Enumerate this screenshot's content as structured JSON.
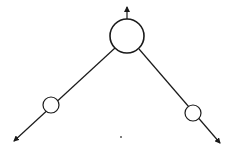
{
  "diagram": {
    "type": "feynman-vertex",
    "stroke_color": "#1a1a1a",
    "background": "#ffffff",
    "vertex": {
      "cx": 127,
      "cy": 36,
      "r": 17
    },
    "top_line": {
      "x1": 127,
      "y1": 19,
      "x2": 127,
      "y2": 7,
      "arrow": "up"
    },
    "left_branch": {
      "line": {
        "x1": 115,
        "y1": 48,
        "x2": 14,
        "y2": 141
      },
      "node": {
        "cx": 51,
        "cy": 105,
        "r": 8
      },
      "arrow": "down-left"
    },
    "right_branch": {
      "line": {
        "x1": 139,
        "y1": 49,
        "x2": 220,
        "y2": 143
      },
      "node": {
        "cx": 193,
        "cy": 113,
        "r": 8
      },
      "arrow": "down-right"
    },
    "dot": {
      "cx": 121,
      "cy": 137,
      "r": 1
    }
  }
}
